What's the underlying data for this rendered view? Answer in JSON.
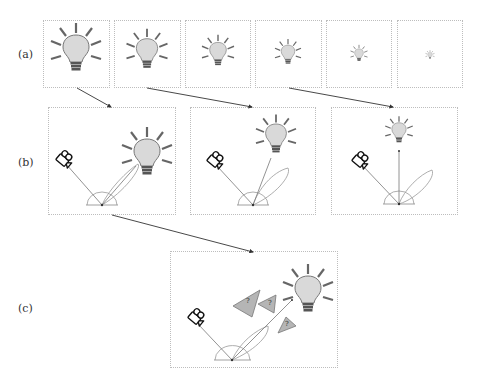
{
  "figure": {
    "rows": [
      {
        "id": "a",
        "label": "(a)",
        "label_pos": [
          18,
          55
        ]
      },
      {
        "id": "b",
        "label": "(b)",
        "label_pos": [
          18,
          163
        ]
      },
      {
        "id": "c",
        "label": "(c)",
        "label_pos": [
          18,
          310
        ]
      }
    ],
    "colors": {
      "border": "#bdbdbd",
      "bulb_fill": "#d9d9d9",
      "bulb_stroke": "#666666",
      "ray": "#666666",
      "base": "#555555",
      "occluder_fill": "#b5b5b5",
      "occluder_stroke": "#777777",
      "arrow": "#333333"
    },
    "row_a": {
      "panels": [
        {
          "x": 43,
          "y": 20,
          "w": 67,
          "h": 68,
          "scale": 1.0
        },
        {
          "x": 114,
          "y": 20,
          "w": 67,
          "h": 68,
          "scale": 0.8
        },
        {
          "x": 185,
          "y": 20,
          "w": 66,
          "h": 68,
          "scale": 0.62
        },
        {
          "x": 255,
          "y": 20,
          "w": 67,
          "h": 68,
          "scale": 0.5
        },
        {
          "x": 326,
          "y": 20,
          "w": 66,
          "h": 68,
          "scale": 0.34
        },
        {
          "x": 397,
          "y": 20,
          "w": 66,
          "h": 68,
          "scale": 0.18
        }
      ]
    },
    "row_b": {
      "panels": [
        {
          "x": 48,
          "y": 107,
          "w": 128,
          "h": 108,
          "bulb": [
            100,
            40
          ],
          "bulb_scale": 0.9,
          "lobe_angle": -45
        },
        {
          "x": 190,
          "y": 107,
          "w": 126,
          "h": 108,
          "bulb": [
            92,
            22
          ],
          "bulb_scale": 0.78,
          "lobe_angle": -30
        },
        {
          "x": 331,
          "y": 107,
          "w": 127,
          "h": 108,
          "bulb": [
            68,
            22
          ],
          "bulb_scale": 0.55,
          "lobe_angle": -25
        }
      ]
    },
    "row_c": {
      "panel": {
        "x": 170,
        "y": 251,
        "w": 168,
        "h": 117
      },
      "occluders": [
        {
          "label": "?"
        },
        {
          "label": "?"
        },
        {
          "label": "?"
        }
      ]
    },
    "arrows": [
      {
        "from": [
          77,
          88
        ],
        "to": [
          111,
          107
        ]
      },
      {
        "from": [
          147,
          88
        ],
        "to": [
          252,
          107
        ]
      },
      {
        "from": [
          289,
          88
        ],
        "to": [
          393,
          107
        ]
      },
      {
        "from": [
          112,
          215
        ],
        "to": [
          253,
          252
        ]
      }
    ]
  }
}
